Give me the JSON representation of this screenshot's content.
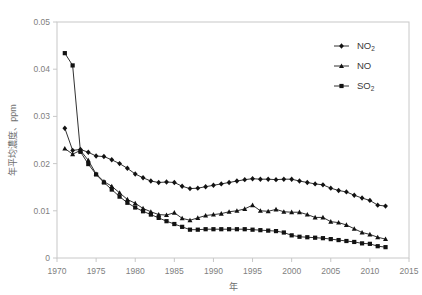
{
  "chart_data": {
    "type": "line",
    "title": "",
    "xlabel": "年",
    "ylabel": "年平均濃度、ppm",
    "xlim": [
      1970,
      2015
    ],
    "ylim": [
      0,
      0.05
    ],
    "grid": false,
    "legend_position": "top-right",
    "x_ticks": [
      "1970",
      "1975",
      "1980",
      "1985",
      "1990",
      "1995",
      "2000",
      "2005",
      "2010",
      "2015"
    ],
    "x_tick_values": [
      1970,
      1975,
      1980,
      1985,
      1990,
      1995,
      2000,
      2005,
      2010,
      2015
    ],
    "y_ticks": [
      "0",
      "0.01",
      "0.02",
      "0.03",
      "0.04",
      "0.05"
    ],
    "y_tick_values": [
      0,
      0.01,
      0.02,
      0.03,
      0.04,
      0.05
    ],
    "x": [
      1971,
      1972,
      1973,
      1974,
      1975,
      1976,
      1977,
      1978,
      1979,
      1980,
      1981,
      1982,
      1983,
      1984,
      1985,
      1986,
      1987,
      1988,
      1989,
      1990,
      1991,
      1992,
      1993,
      1994,
      1995,
      1996,
      1997,
      1998,
      1999,
      2000,
      2001,
      2002,
      2003,
      2004,
      2005,
      2006,
      2007,
      2008,
      2009,
      2010,
      2011,
      2012
    ],
    "series": [
      {
        "name": "NO2",
        "label": "NO₂",
        "marker": "diamond",
        "color": "#121212",
        "values": [
          0.0275,
          0.0228,
          0.023,
          0.0224,
          0.0216,
          0.0215,
          0.0208,
          0.02,
          0.019,
          0.0178,
          0.017,
          0.0163,
          0.016,
          0.0161,
          0.016,
          0.0152,
          0.0147,
          0.0148,
          0.0151,
          0.0154,
          0.0157,
          0.016,
          0.0163,
          0.0166,
          0.0168,
          0.0167,
          0.0167,
          0.0166,
          0.0167,
          0.0167,
          0.0163,
          0.016,
          0.0157,
          0.0155,
          0.0148,
          0.0143,
          0.014,
          0.0133,
          0.0127,
          0.0122,
          0.0112,
          0.011
        ]
      },
      {
        "name": "NO",
        "label": "NO",
        "marker": "triangle",
        "color": "#121212",
        "values": [
          0.0232,
          0.022,
          0.0228,
          0.0207,
          0.0178,
          0.0162,
          0.0152,
          0.0138,
          0.0124,
          0.0116,
          0.0105,
          0.0098,
          0.0092,
          0.0091,
          0.0096,
          0.0084,
          0.008,
          0.0085,
          0.009,
          0.0092,
          0.0094,
          0.0098,
          0.01,
          0.0104,
          0.0112,
          0.01,
          0.0099,
          0.0103,
          0.0098,
          0.0097,
          0.0097,
          0.0092,
          0.0086,
          0.0086,
          0.0077,
          0.0075,
          0.007,
          0.0062,
          0.0054,
          0.005,
          0.0044,
          0.004
        ]
      },
      {
        "name": "SO2",
        "label": "SO₂",
        "marker": "square",
        "color": "#121212",
        "values": [
          0.0434,
          0.0408,
          0.0225,
          0.0199,
          0.0177,
          0.016,
          0.0145,
          0.013,
          0.0117,
          0.0107,
          0.0099,
          0.0092,
          0.0085,
          0.0078,
          0.0072,
          0.0066,
          0.006,
          0.006,
          0.0061,
          0.0061,
          0.0061,
          0.0061,
          0.0061,
          0.0061,
          0.006,
          0.0059,
          0.0058,
          0.0057,
          0.0054,
          0.0048,
          0.0045,
          0.0044,
          0.0043,
          0.0042,
          0.004,
          0.0038,
          0.0036,
          0.0034,
          0.0031,
          0.003,
          0.0025,
          0.0023
        ]
      }
    ]
  }
}
